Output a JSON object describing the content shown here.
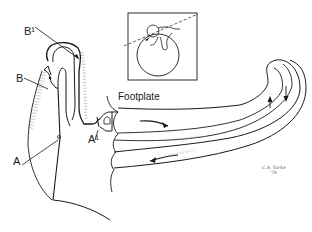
{
  "diagram": {
    "type": "anatomical line drawing (middle/inner ear: ossicular chain, footplate and cochlear duct)",
    "labels": {
      "b_prime": "B¹",
      "b": "B",
      "a": "A",
      "a_prime": "A¹",
      "footplate": "Footplate"
    },
    "signature": {
      "line1": "C.A. Yorke",
      "line2": "'78"
    },
    "colors": {
      "ink": "#1a1a1a",
      "stipple": "#9a9a9a",
      "background": "#ffffff"
    }
  }
}
